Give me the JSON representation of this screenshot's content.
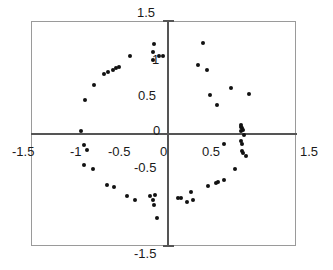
{
  "chart_data": {
    "type": "scatter",
    "title": "",
    "subtitle": "",
    "xlabel": "",
    "ylabel": "",
    "xlim": [
      -1.5,
      1.5
    ],
    "ylim": [
      -1.5,
      1.5
    ],
    "grid": false,
    "legend": null,
    "axis_style": "crossed-axes-at-origin-with-outer-frame",
    "xticks": [
      -1.5,
      -1,
      -0.5,
      0,
      0.5,
      1.5
    ],
    "xtick_labels": [
      "-1.5",
      "-1",
      "-0.5",
      "0",
      "0.5",
      "1.5"
    ],
    "yticks": [
      1.5,
      1,
      0.5,
      0,
      -0.5,
      -1.5
    ],
    "ytick_labels": [
      "1.5",
      "1",
      "0.5",
      "0",
      "-0.5",
      "-1.5"
    ],
    "marker": "filled-diamond",
    "marker_color": "#111111",
    "marker_size": 4,
    "series": [
      {
        "name": "points",
        "points": [
          [
            -0.16,
            1.21
          ],
          [
            -0.17,
            1.1
          ],
          [
            -0.44,
            1.05
          ],
          [
            -0.11,
            1.04
          ],
          [
            -0.06,
            1.04
          ],
          [
            -0.18,
            0.99
          ],
          [
            -0.57,
            0.9
          ],
          [
            -0.61,
            0.88
          ],
          [
            -0.65,
            0.86
          ],
          [
            -0.7,
            0.83
          ],
          [
            -0.75,
            0.8
          ],
          [
            -0.87,
            0.66
          ],
          [
            -0.97,
            0.46
          ],
          [
            -1.02,
            0.04
          ],
          [
            -0.99,
            -0.15
          ],
          [
            -0.95,
            -0.22
          ],
          [
            -0.98,
            -0.42
          ],
          [
            -0.88,
            -0.47
          ],
          [
            -0.72,
            -0.68
          ],
          [
            -0.63,
            -0.71
          ],
          [
            -0.48,
            -0.83
          ],
          [
            -0.39,
            -0.89
          ],
          [
            -0.21,
            -0.83
          ],
          [
            -0.15,
            -0.82
          ],
          [
            -0.17,
            -0.89
          ],
          [
            -0.16,
            -0.95
          ],
          [
            -0.13,
            -1.12
          ],
          [
            0.41,
            1.22
          ],
          [
            0.35,
            0.93
          ],
          [
            0.46,
            0.86
          ],
          [
            0.74,
            0.62
          ],
          [
            0.95,
            0.53
          ],
          [
            0.49,
            0.52
          ],
          [
            0.57,
            0.39
          ],
          [
            0.85,
            0.12
          ],
          [
            0.86,
            0.1
          ],
          [
            0.87,
            0.08
          ],
          [
            0.88,
            0.06
          ],
          [
            0.86,
            0.04
          ],
          [
            0.89,
            -0.02
          ],
          [
            0.86,
            -0.09
          ],
          [
            0.66,
            -0.13
          ],
          [
            0.87,
            -0.13
          ],
          [
            0.87,
            -0.23
          ],
          [
            0.88,
            -0.26
          ],
          [
            0.91,
            -0.3
          ],
          [
            0.78,
            -0.47
          ],
          [
            0.66,
            -0.61
          ],
          [
            0.59,
            -0.64
          ],
          [
            0.56,
            -0.65
          ],
          [
            0.47,
            -0.7
          ],
          [
            0.27,
            -0.78
          ],
          [
            0.12,
            -0.86
          ],
          [
            0.15,
            -0.86
          ],
          [
            0.29,
            -0.88
          ],
          [
            0.22,
            -0.91
          ]
        ]
      }
    ]
  }
}
